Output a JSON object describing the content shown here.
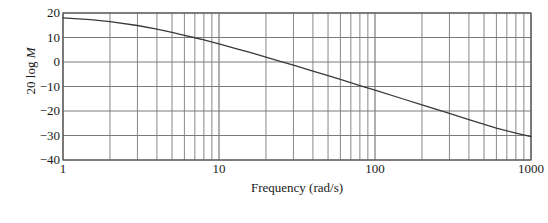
{
  "chart_data": {
    "type": "line",
    "title": "",
    "xlabel": "Frequency (rad/s)",
    "ylabel": "20 log M",
    "ylabel_plain": "20 log ",
    "ylabel_italic": "M",
    "xscale": "log",
    "xlim": [
      1,
      1000
    ],
    "ylim": [
      -40,
      20
    ],
    "xticks": [
      1,
      10,
      100,
      1000
    ],
    "xtick_labels": [
      "1",
      "10",
      "100",
      "1000"
    ],
    "yticks": [
      20,
      10,
      0,
      -10,
      -20,
      -30,
      -40
    ],
    "ytick_labels": [
      "20",
      "10",
      "0",
      "−10",
      "−20",
      "−30",
      "−40"
    ],
    "grid": true,
    "grid_minor": true,
    "legend": "none",
    "series": [
      {
        "name": "20 log M",
        "x": [
          1,
          1.5,
          2,
          3,
          4,
          5,
          6,
          7,
          8,
          10,
          13,
          16,
          20,
          25,
          30,
          40,
          50,
          60,
          80,
          100,
          150,
          200,
          300,
          400,
          600,
          800,
          1000
        ],
        "y": [
          18.0,
          17.3,
          16.5,
          14.9,
          13.4,
          12.1,
          10.9,
          9.9,
          9.0,
          7.4,
          5.4,
          3.8,
          2.0,
          0.2,
          -1.3,
          -3.7,
          -5.6,
          -7.1,
          -9.6,
          -11.5,
          -15.0,
          -17.5,
          -21.0,
          -23.5,
          -27.0,
          -29.0,
          -30.5
        ]
      }
    ],
    "colors": {
      "curve": "#3a3a3a",
      "grid": "#7a7a7a",
      "axis": "#555555",
      "text": "#1a1a1a",
      "background": "#ffffff"
    }
  }
}
